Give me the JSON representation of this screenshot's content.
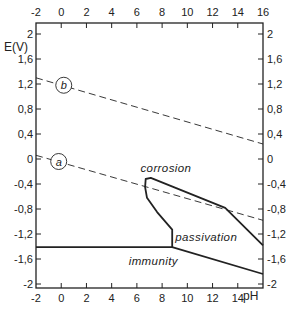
{
  "chart_data": {
    "type": "line",
    "title": "",
    "xlabel": "pH",
    "ylabel": "E(V)",
    "xlim": [
      -2,
      16
    ],
    "ylim": [
      -2,
      2
    ],
    "grid": false,
    "x_ticks": [
      -2,
      0,
      2,
      4,
      6,
      8,
      10,
      12,
      14,
      16
    ],
    "x_tick_labels_top": [
      "-2",
      "0",
      "2",
      "4",
      "6",
      "8",
      "10",
      "12",
      "14",
      "16"
    ],
    "x_tick_labels_bottom": [
      "-2",
      "0",
      "2",
      "4",
      "6",
      "8",
      "10",
      "12",
      "14"
    ],
    "y_ticks": [
      2,
      1.6,
      1.2,
      0.8,
      0.4,
      0,
      -0.4,
      -0.8,
      -1.2,
      -1.6,
      -2
    ],
    "y_tick_labels": [
      "2",
      "1,6",
      "1,2",
      "0,8",
      "0,4",
      "0",
      "-0,4",
      "-0,8",
      "-1,2",
      "-1,6",
      "-2"
    ],
    "series": [
      {
        "name": "a",
        "style": "dashed",
        "points": [
          [
            -2,
            0.06
          ],
          [
            16,
            -0.98
          ]
        ],
        "label_at": [
          -0.2,
          -0.04
        ]
      },
      {
        "name": "b",
        "style": "dashed",
        "points": [
          [
            -2,
            1.3
          ],
          [
            16,
            0.24
          ]
        ],
        "label_at": [
          0.2,
          1.18
        ]
      },
      {
        "name": "corrosion-boundary",
        "style": "solid",
        "points": [
          [
            8.8,
            -1.41
          ],
          [
            8.8,
            -1.13
          ],
          [
            7.6,
            -0.85
          ],
          [
            6.8,
            -0.62
          ],
          [
            6.65,
            -0.45
          ],
          [
            6.7,
            -0.32
          ],
          [
            7.1,
            -0.3
          ],
          [
            13.0,
            -0.78
          ],
          [
            16,
            -1.38
          ]
        ]
      },
      {
        "name": "immunity-boundary",
        "style": "solid",
        "points": [
          [
            -2,
            -1.41
          ],
          [
            8.8,
            -1.41
          ],
          [
            16,
            -1.84
          ]
        ]
      }
    ],
    "annotations": [
      {
        "text": "corrosion",
        "x": 8.3,
        "y": -0.21
      },
      {
        "text": "passivation",
        "x": 11.5,
        "y": -1.31
      },
      {
        "text": "immunity",
        "x": 7.3,
        "y": -1.7
      }
    ]
  }
}
